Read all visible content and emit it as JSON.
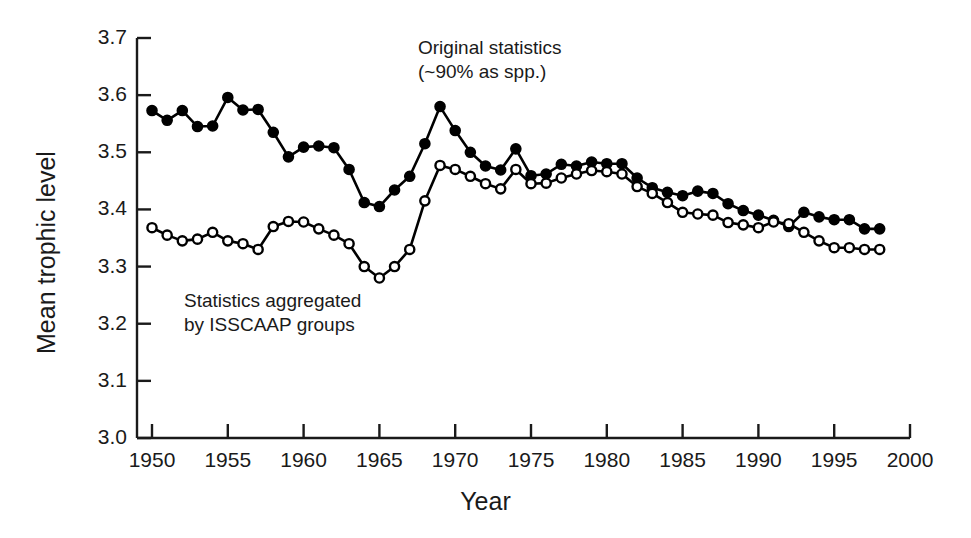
{
  "chart_data": {
    "type": "line",
    "title": "",
    "xlabel": "Year",
    "ylabel": "Mean trophic level",
    "xlim": [
      1950,
      2000
    ],
    "ylim": [
      3.0,
      3.7
    ],
    "xticks": [
      1950,
      1955,
      1960,
      1965,
      1970,
      1975,
      1980,
      1985,
      1990,
      1995,
      2000
    ],
    "yticks": [
      "3.0",
      "3.1",
      "3.2",
      "3.3",
      "3.4",
      "3.5",
      "3.6",
      "3.7"
    ],
    "grid": false,
    "legend_position": "inline-annotations",
    "annotations": [
      {
        "id": "annot-original",
        "line1": "Original statistics",
        "line2": "(~90% as spp.)"
      },
      {
        "id": "annot-isscaap",
        "line1": "Statistics aggregated",
        "line2": "by ISSCAAP groups"
      }
    ],
    "x": [
      1950,
      1951,
      1952,
      1953,
      1954,
      1955,
      1956,
      1957,
      1958,
      1959,
      1960,
      1961,
      1962,
      1963,
      1964,
      1965,
      1966,
      1967,
      1968,
      1969,
      1970,
      1971,
      1972,
      1973,
      1974,
      1975,
      1976,
      1977,
      1978,
      1979,
      1980,
      1981,
      1982,
      1983,
      1984,
      1985,
      1986,
      1987,
      1988,
      1989,
      1990,
      1991,
      1992,
      1993,
      1994,
      1995,
      1996,
      1997,
      1998
    ],
    "series": [
      {
        "name": "Original statistics (~90% as spp.)",
        "marker": "filled-circle",
        "color": "#000000",
        "values": [
          3.573,
          3.556,
          3.573,
          3.545,
          3.546,
          3.596,
          3.574,
          3.575,
          3.535,
          3.492,
          3.509,
          3.511,
          3.508,
          3.47,
          3.412,
          3.405,
          3.434,
          3.458,
          3.515,
          3.58,
          3.538,
          3.5,
          3.476,
          3.469,
          3.506,
          3.459,
          3.462,
          3.479,
          3.476,
          3.483,
          3.48,
          3.48,
          3.455,
          3.438,
          3.43,
          3.424,
          3.432,
          3.428,
          3.41,
          3.398,
          3.39,
          3.381,
          3.37,
          3.395,
          3.387,
          3.382,
          3.382,
          3.366,
          3.366
        ]
      },
      {
        "name": "Statistics aggregated by ISSCAAP groups",
        "marker": "open-circle",
        "color": "#000000",
        "values": [
          3.368,
          3.355,
          3.345,
          3.348,
          3.36,
          3.345,
          3.34,
          3.33,
          3.37,
          3.379,
          3.378,
          3.366,
          3.355,
          3.34,
          3.3,
          3.28,
          3.3,
          3.33,
          3.415,
          3.477,
          3.47,
          3.458,
          3.445,
          3.436,
          3.47,
          3.445,
          3.446,
          3.455,
          3.462,
          3.468,
          3.466,
          3.462,
          3.44,
          3.428,
          3.412,
          3.395,
          3.392,
          3.39,
          3.377,
          3.373,
          3.368,
          3.378,
          3.375,
          3.36,
          3.345,
          3.333,
          3.333,
          3.33,
          3.33
        ]
      }
    ]
  }
}
